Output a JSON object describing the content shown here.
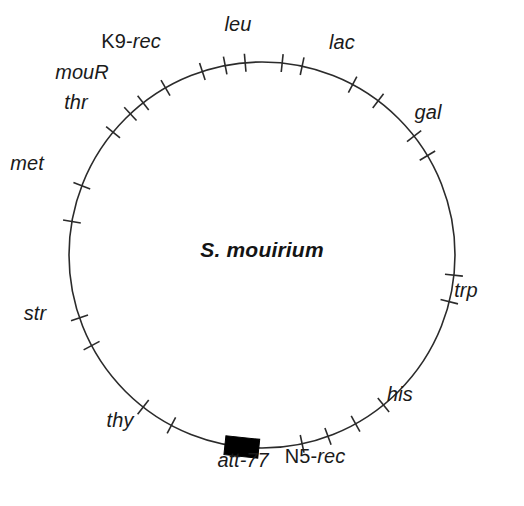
{
  "figure": {
    "type": "circular-genetic-map",
    "organism": "S. mouirium",
    "background_color": "#ffffff",
    "line_color": "#2b2b2b",
    "marker_color": "#000000"
  },
  "circle": {
    "center_x": 262,
    "center_y": 255,
    "radius": 193,
    "stroke_width": 1.6
  },
  "center_label": {
    "text": "S. mouirium",
    "x": 262,
    "y": 250
  },
  "loci": [
    {
      "id": "leu",
      "label": "leu",
      "style": "italic",
      "label_x": 238,
      "label_y": 24,
      "ticks": [
        {
          "angle_deg": -84.0
        },
        {
          "angle_deg": -78.0
        }
      ]
    },
    {
      "id": "k9-rec",
      "label": "K9-rec",
      "style": "mixed",
      "upright_part": "K9-",
      "italic_part": "rec",
      "label_x": 131,
      "label_y": 41,
      "ticks": [
        {
          "angle_deg": -108.0
        },
        {
          "angle_deg": -101.0
        },
        {
          "angle_deg": -95.0
        }
      ]
    },
    {
      "id": "mouR",
      "label": "mouR",
      "style": "italic",
      "label_x": 82,
      "label_y": 72,
      "ticks": [
        {
          "angle_deg": -120.0
        }
      ]
    },
    {
      "id": "thr",
      "label": "thr",
      "style": "italic",
      "label_x": 76,
      "label_y": 102,
      "ticks": [
        {
          "angle_deg": -133.0
        },
        {
          "angle_deg": -128.0
        },
        {
          "angle_deg": -140.5
        }
      ]
    },
    {
      "id": "met",
      "label": "met",
      "style": "italic",
      "label_x": 27,
      "label_y": 163,
      "ticks": [
        {
          "angle_deg": -159.0
        },
        {
          "angle_deg": -170.0
        }
      ]
    },
    {
      "id": "str",
      "label": "str",
      "style": "italic",
      "label_x": 35,
      "label_y": 313,
      "ticks": [
        {
          "angle_deg": 161.0
        },
        {
          "angle_deg": 152.0
        }
      ]
    },
    {
      "id": "thy",
      "label": "thy",
      "style": "italic",
      "label_x": 120,
      "label_y": 420,
      "ticks": [
        {
          "angle_deg": 128.0
        },
        {
          "angle_deg": 118.0
        }
      ]
    },
    {
      "id": "att-77",
      "label": "att-77",
      "style": "italic",
      "label_x": 243,
      "label_y": 460,
      "is_block": true,
      "block": {
        "angle_deg": 96.0,
        "width": 34,
        "height": 19
      },
      "ticks": []
    },
    {
      "id": "n5-rec",
      "label": "N5-rec",
      "style": "mixed",
      "upright_part": "N5-",
      "italic_part": "rec",
      "label_x": 315,
      "label_y": 456,
      "ticks": [
        {
          "angle_deg": 78.0
        },
        {
          "angle_deg": 70.0
        }
      ]
    },
    {
      "id": "his",
      "label": "his",
      "style": "italic",
      "label_x": 400,
      "label_y": 394,
      "ticks": [
        {
          "angle_deg": 61.0
        },
        {
          "angle_deg": 51.0
        }
      ]
    },
    {
      "id": "trp",
      "label": "trp",
      "style": "italic",
      "label_x": 466,
      "label_y": 290,
      "ticks": [
        {
          "angle_deg": 14.0
        },
        {
          "angle_deg": 6.0
        }
      ]
    },
    {
      "id": "gal",
      "label": "gal",
      "style": "italic",
      "label_x": 428,
      "label_y": 112,
      "ticks": [
        {
          "angle_deg": -38.0
        },
        {
          "angle_deg": -31.0
        }
      ]
    },
    {
      "id": "lac",
      "label": "lac",
      "style": "italic",
      "label_x": 342,
      "label_y": 42,
      "ticks": [
        {
          "angle_deg": -62.0
        },
        {
          "angle_deg": -53.0
        }
      ]
    }
  ],
  "tick": {
    "inner_offset": 9,
    "outer_offset": 9,
    "stroke_width": 1.6
  }
}
